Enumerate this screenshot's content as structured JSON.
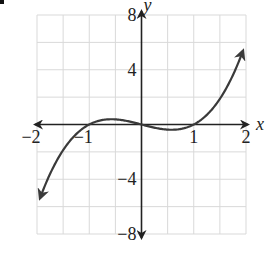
{
  "chart_data": {
    "type": "line",
    "title": "",
    "xlabel": "x",
    "ylabel": "y",
    "function": "y = x^3 - x",
    "xlim": [
      -2,
      2
    ],
    "ylim": [
      -8,
      8
    ],
    "grid": true,
    "grid_x_step": 0.5,
    "grid_y_step": 2,
    "x_tick_labels": [
      {
        "value": -2,
        "label": "−2"
      },
      {
        "value": -1,
        "label": "−1"
      },
      {
        "value": 1,
        "label": "1"
      },
      {
        "value": 2,
        "label": "2"
      }
    ],
    "y_tick_labels": [
      {
        "value": 8,
        "label": "8"
      },
      {
        "value": 4,
        "label": "4"
      },
      {
        "value": -4,
        "label": "−4"
      },
      {
        "value": -8,
        "label": "−8"
      }
    ],
    "series": [
      {
        "name": "f(x)",
        "x": [
          -2,
          -1.75,
          -1.5,
          -1.25,
          -1,
          -0.75,
          -0.577,
          -0.5,
          -0.25,
          0,
          0.25,
          0.5,
          0.577,
          0.75,
          1,
          1.25,
          1.5,
          1.75,
          2
        ],
        "values": [
          -6,
          -3.61,
          -1.875,
          -0.703,
          0,
          0.328,
          0.385,
          0.375,
          0.234,
          0,
          -0.234,
          -0.375,
          -0.385,
          -0.328,
          0,
          0.703,
          1.875,
          3.61,
          6
        ],
        "arrows": "both-ends"
      }
    ],
    "key_points": {
      "roots": [
        -1,
        0,
        1
      ],
      "local_max": {
        "x": -0.577,
        "y": 0.385
      },
      "local_min": {
        "x": 0.577,
        "y": -0.385
      }
    },
    "colors": {
      "curve": "#3a3a3a",
      "axes": "#222222",
      "grid": "#d9d9d9"
    }
  }
}
